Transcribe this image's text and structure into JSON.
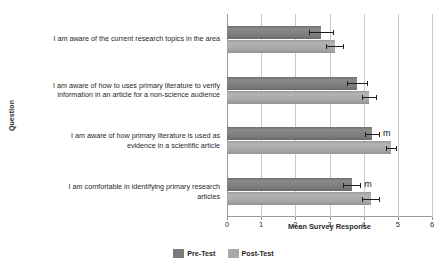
{
  "chart_data": {
    "type": "bar",
    "orientation": "horizontal",
    "title": "",
    "xlabel": "Mean Survey Response",
    "ylabel": "Question",
    "xlim": [
      0,
      6
    ],
    "xticks": [
      0,
      1,
      2,
      3,
      4,
      5,
      6
    ],
    "grid": true,
    "legend_position": "bottom",
    "categories": [
      "I am aware of the current research topics in the area",
      "I am aware of how to uses primary literature to verify\ninformation in an article for a non-science audience",
      "I am aware of how primary literature is used as\nevidence in a scientific article",
      "I am comfortable in identifying primary research\narticles"
    ],
    "series": [
      {
        "name": "Pre-Test",
        "color": "#7b7b7b",
        "values": [
          2.75,
          3.8,
          4.25,
          3.65
        ],
        "errors": [
          0.35,
          0.3,
          0.2,
          0.25
        ]
      },
      {
        "name": "Post-Test",
        "color": "#a8a8a8",
        "values": [
          3.15,
          4.15,
          4.8,
          4.2
        ],
        "errors": [
          0.25,
          0.2,
          0.15,
          0.25
        ]
      }
    ],
    "annotations": [
      {
        "text": "m",
        "category_index": 2,
        "series": "Pre-Test",
        "value": 4.25
      },
      {
        "text": "m",
        "category_index": 3,
        "series": "Pre-Test",
        "value": 3.65
      }
    ]
  },
  "legend": {
    "items": [
      {
        "label": "Pre-Test",
        "color": "#7b7b7b"
      },
      {
        "label": "Post-Test",
        "color": "#a8a8a8"
      }
    ]
  }
}
